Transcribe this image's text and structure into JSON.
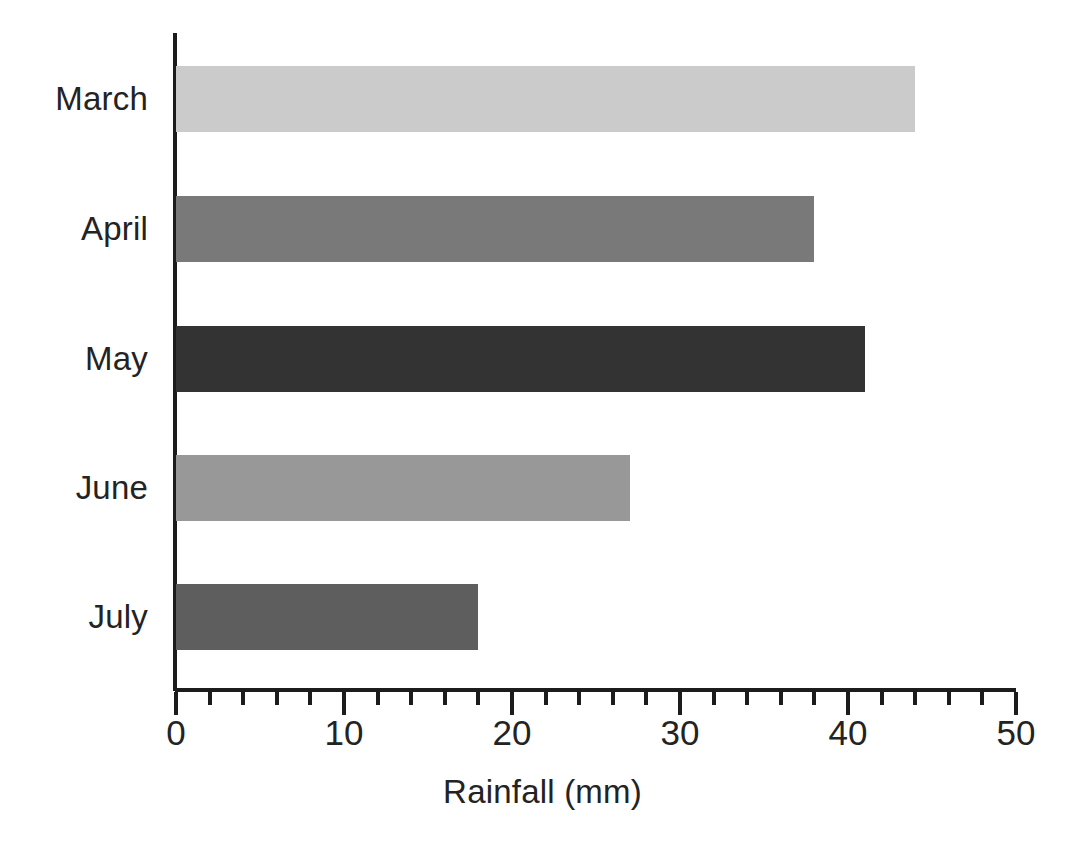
{
  "chart_data": {
    "type": "bar",
    "orientation": "horizontal",
    "title": "",
    "subtitle": "",
    "xlabel": "Rainfall (mm)",
    "ylabel": "",
    "categories": [
      "March",
      "April",
      "May",
      "June",
      "July"
    ],
    "values": [
      44,
      38,
      41,
      27,
      18
    ],
    "series": [
      {
        "name": "Rainfall",
        "values": [
          44,
          38,
          41,
          27,
          18
        ]
      }
    ],
    "bar_colors": [
      "#cbcbcb",
      "#797979",
      "#333333",
      "#989898",
      "#5e5e5e"
    ],
    "xlim": [
      0,
      50
    ],
    "x_major_ticks": [
      0,
      10,
      20,
      30,
      40,
      50
    ],
    "x_tick_labels": [
      "0",
      "10",
      "20",
      "30",
      "40",
      "50"
    ],
    "x_minor_tick_interval": 2,
    "grid": false,
    "legend": false,
    "legend_position": "none",
    "annotations": [],
    "axis_color": "#1c1c1c",
    "background_color": "#ffffff"
  },
  "bars": [
    {
      "label": "March",
      "value": 44,
      "color": "#cbcbcb"
    },
    {
      "label": "April",
      "value": 38,
      "color": "#797979"
    },
    {
      "label": "May",
      "value": 41,
      "color": "#333333"
    },
    {
      "label": "June",
      "value": 27,
      "color": "#989898"
    },
    {
      "label": "July",
      "value": 18,
      "color": "#5e5e5e"
    }
  ]
}
